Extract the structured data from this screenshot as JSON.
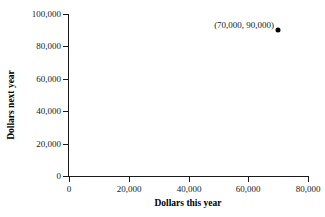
{
  "chart_data": {
    "type": "scatter",
    "title": "",
    "subtitle": "",
    "xlabel": "Dollars this year",
    "ylabel": "Dollars next year",
    "xlim": [
      0,
      80000
    ],
    "ylim": [
      0,
      100000
    ],
    "xticks": [
      0,
      20000,
      40000,
      60000,
      80000
    ],
    "yticks": [
      0,
      20000,
      40000,
      60000,
      80000,
      100000
    ],
    "xticklabels": [
      "0",
      "20,000",
      "40,000",
      "60,000",
      "80,000"
    ],
    "yticklabels": [
      "0",
      "20,000",
      "40,000",
      "60,000",
      "80,000",
      "100,000"
    ],
    "grid": false,
    "legend": null,
    "series": [
      {
        "name": "",
        "x": [
          70000
        ],
        "y": [
          90000
        ],
        "marker": "filled-circle",
        "color": "#000000"
      }
    ],
    "annotations": [
      {
        "text": "(70,000, 90,000)",
        "x": 70000,
        "y": 90000,
        "position": "left-of-point"
      }
    ]
  },
  "colors": {
    "background": "#ffffff",
    "ink": "#1a1a1a",
    "marker": "#000000"
  }
}
